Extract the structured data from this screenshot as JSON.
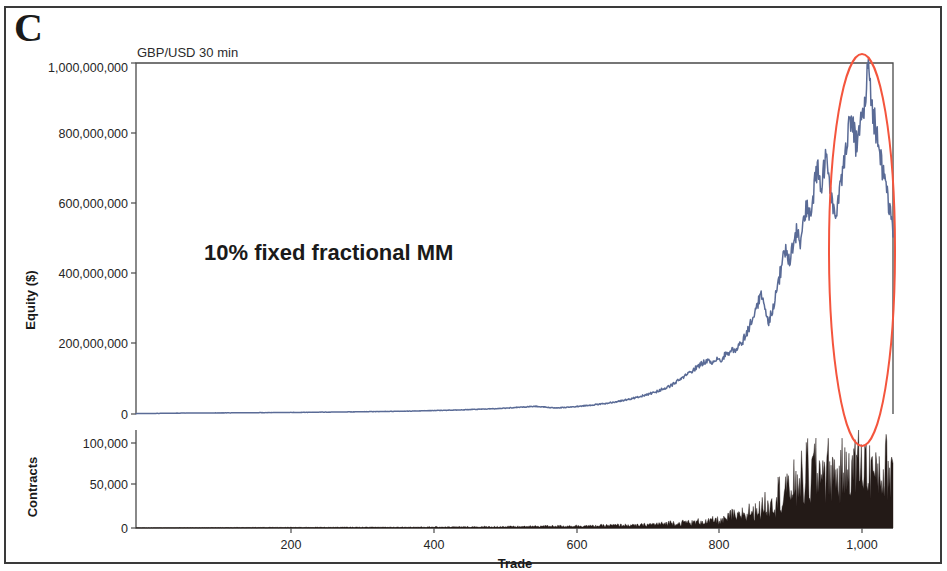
{
  "figure": {
    "panel_label": "C",
    "title": "GBP/USD 30 min",
    "annotation": "10% fixed fractional MM"
  },
  "axes": {
    "equity": {
      "title": "Equity ($)",
      "ticks": [
        "1,000,000,000",
        "800,000,000",
        "600,000,000",
        "400,000,000",
        "200,000,000",
        "0"
      ]
    },
    "contracts": {
      "title": "Contracts",
      "ticks": [
        "100,000",
        "50,000",
        "0"
      ]
    },
    "x": {
      "title": "Trade",
      "ticks": [
        "200",
        "400",
        "600",
        "800",
        "1,000"
      ]
    }
  },
  "colors": {
    "equity_line": "#5a6b96",
    "contracts_fill": "#231a17",
    "highlight_ellipse": "#f4553d",
    "axis": "#4a4a4a",
    "frame": "#3a3a3a",
    "text": "#1a1a1a"
  },
  "highlight": {
    "shape": "ellipse",
    "label": "drawdown-highlight-ellipse",
    "center_trade": 1000,
    "center_equity": 500000000
  },
  "chart_data": {
    "type": "line",
    "title": "GBP/USD 30 min",
    "subtitle": "10% fixed fractional MM",
    "xlabel": "Trade",
    "ylabel": "Equity ($)",
    "xlim": [
      0,
      1060
    ],
    "grid": false,
    "legend": "none",
    "panels": [
      {
        "name": "equity",
        "ylabel": "Equity ($)",
        "ylim": [
          0,
          1000000000
        ],
        "yticks": [
          0,
          200000000,
          400000000,
          600000000,
          800000000,
          1000000000
        ],
        "series": [
          {
            "name": "Equity",
            "color": "#5a6b96",
            "x": [
              0,
              20,
              40,
              60,
              80,
              100,
              120,
              140,
              160,
              180,
              200,
              220,
              240,
              260,
              280,
              300,
              320,
              340,
              360,
              380,
              400,
              420,
              440,
              460,
              480,
              500,
              520,
              540,
              550,
              560,
              570,
              580,
              590,
              600,
              610,
              620,
              630,
              640,
              650,
              660,
              670,
              680,
              690,
              700,
              710,
              720,
              730,
              740,
              750,
              760,
              770,
              780,
              790,
              800,
              810,
              815,
              820,
              825,
              830,
              835,
              840,
              845,
              850,
              855,
              860,
              865,
              870,
              875,
              880,
              885,
              890,
              895,
              900,
              905,
              910,
              915,
              920,
              925,
              930,
              935,
              940,
              945,
              950,
              955,
              960,
              965,
              970,
              975,
              980,
              985,
              990,
              995,
              1000,
              1005,
              1010,
              1015,
              1020,
              1025,
              1030,
              1035,
              1040,
              1045,
              1050,
              1055,
              1060
            ],
            "y": [
              1000000,
              1500000,
              2000000,
              2500000,
              2800000,
              3000000,
              3200000,
              3400000,
              3600000,
              3900000,
              4200000,
              4500000,
              4800000,
              5200000,
              5600000,
              6000000,
              6500000,
              7000000,
              7500000,
              8200000,
              9000000,
              10000000,
              11000000,
              12000000,
              13500000,
              15000000,
              17000000,
              19500000,
              21000000,
              22000000,
              20000000,
              18000000,
              17500000,
              18500000,
              20000000,
              22000000,
              24000000,
              26000000,
              28000000,
              31000000,
              34000000,
              38000000,
              42000000,
              47000000,
              52000000,
              58000000,
              65000000,
              73000000,
              82000000,
              95000000,
              110000000,
              125000000,
              140000000,
              155000000,
              145000000,
              160000000,
              150000000,
              170000000,
              165000000,
              185000000,
              180000000,
              200000000,
              210000000,
              230000000,
              255000000,
              280000000,
              310000000,
              345000000,
              300000000,
              260000000,
              290000000,
              330000000,
              380000000,
              430000000,
              470000000,
              440000000,
              480000000,
              520000000,
              490000000,
              540000000,
              600000000,
              560000000,
              650000000,
              700000000,
              640000000,
              720000000,
              690000000,
              600000000,
              560000000,
              620000000,
              700000000,
              780000000,
              860000000,
              800000000,
              760000000,
              820000000,
              900000000,
              980000000,
              900000000,
              820000000,
              760000000,
              700000000,
              640000000,
              580000000,
              520000000
            ]
          }
        ]
      },
      {
        "name": "contracts",
        "ylabel": "Contracts",
        "ylim": [
          0,
          115000
        ],
        "yticks": [
          0,
          50000,
          100000
        ],
        "series": [
          {
            "name": "Contracts",
            "color": "#231a17",
            "x": [
              0,
              50,
              100,
              150,
              200,
              250,
              300,
              350,
              400,
              450,
              500,
              550,
              580,
              600,
              620,
              640,
              660,
              680,
              700,
              720,
              740,
              750,
              760,
              770,
              780,
              790,
              800,
              810,
              820,
              830,
              835,
              840,
              845,
              850,
              855,
              860,
              865,
              870,
              875,
              880,
              885,
              890,
              895,
              900,
              905,
              910,
              915,
              920,
              925,
              930,
              935,
              940,
              945,
              950,
              955,
              960,
              965,
              970,
              975,
              980,
              985,
              990,
              995,
              1000,
              1005,
              1010,
              1015,
              1020,
              1025,
              1030,
              1035,
              1040,
              1045,
              1050,
              1055,
              1060
            ],
            "y": [
              200,
              300,
              400,
              500,
              600,
              700,
              800,
              900,
              1000,
              1200,
              1400,
              1800,
              2400,
              2200,
              2600,
              2400,
              3000,
              3400,
              3000,
              4200,
              5000,
              6500,
              5200,
              7000,
              6000,
              8000,
              7000,
              9500,
              8000,
              12000,
              17000,
              11000,
              14000,
              19000,
              13000,
              22000,
              16000,
              26000,
              18000,
              32000,
              22000,
              38000,
              26000,
              45000,
              30000,
              52000,
              35000,
              60000,
              40000,
              68000,
              44000,
              74000,
              48000,
              80000,
              52000,
              86000,
              56000,
              72000,
              60000,
              66000,
              52000,
              74000,
              58000,
              82000,
              62000,
              90000,
              66000,
              84000,
              60000,
              76000,
              56000,
              70000,
              58000,
              74000,
              62000,
              80000
            ]
          }
        ]
      }
    ]
  }
}
